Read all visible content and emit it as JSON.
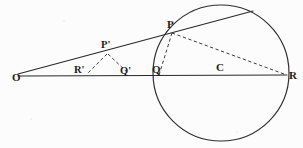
{
  "figure": {
    "caption": "",
    "background_color": "#fcfcfc",
    "ink_color": "#2a2a2a",
    "width": 303,
    "height": 148
  },
  "chart_data": {
    "type": "diagram",
    "title": "",
    "xlabel": "",
    "ylabel": "",
    "points": [
      {
        "id": "O",
        "label": "O",
        "x": 18,
        "y": 76,
        "label_x": 12,
        "label_y": 81
      },
      {
        "id": "Rp",
        "label": "R'",
        "x": 86,
        "y": 75,
        "label_x": 78,
        "label_y": 72
      },
      {
        "id": "Pp",
        "label": "P'",
        "x": 108,
        "y": 52,
        "label_x": 104,
        "label_y": 48
      },
      {
        "id": "Qp",
        "label": "Q'",
        "x": 130,
        "y": 75,
        "label_x": 124,
        "label_y": 74
      },
      {
        "id": "Q",
        "label": "Q",
        "x": 160,
        "y": 76,
        "label_x": 155,
        "label_y": 73
      },
      {
        "id": "P",
        "label": "P",
        "x": 172,
        "y": 33,
        "label_x": 169,
        "label_y": 28
      },
      {
        "id": "C",
        "label": "C",
        "x": 221,
        "y": 75,
        "label_x": 217,
        "label_y": 71
      },
      {
        "id": "R",
        "label": "R",
        "x": 285,
        "y": 75,
        "label_x": 291,
        "label_y": 78
      }
    ],
    "circle": {
      "cx": 221,
      "cy": 73,
      "r": 68,
      "label": "C"
    },
    "segments": [
      {
        "name": "baseline-O-R",
        "from": "O",
        "to": "R",
        "style": "solid",
        "x1": 18,
        "y1": 76,
        "x2": 287,
        "y2": 75
      },
      {
        "name": "secant-O-P",
        "from": "O",
        "to": "top",
        "style": "solid",
        "x1": 18,
        "y1": 74,
        "x2": 253,
        "y2": 11
      },
      {
        "name": "chord-P-R",
        "from": "P",
        "to": "R",
        "style": "dashed",
        "x1": 172,
        "y1": 33,
        "x2": 284,
        "y2": 74
      },
      {
        "name": "chord-P-Q",
        "from": "P",
        "to": "Q",
        "style": "dashed",
        "x1": 172,
        "y1": 33,
        "x2": 159,
        "y2": 75
      },
      {
        "name": "segment-Pp-Rp",
        "from": "P'",
        "to": "R'",
        "style": "dashed",
        "x1": 107,
        "y1": 54,
        "x2": 87,
        "y2": 74
      },
      {
        "name": "segment-Pp-Qp",
        "from": "P'",
        "to": "Q'",
        "style": "dashed",
        "x1": 108,
        "y1": 54,
        "x2": 129,
        "y2": 74
      }
    ],
    "labels": [
      "O",
      "R'",
      "P'",
      "Q'",
      "Q",
      "P",
      "C",
      "R"
    ],
    "legend": [],
    "grid": false
  }
}
